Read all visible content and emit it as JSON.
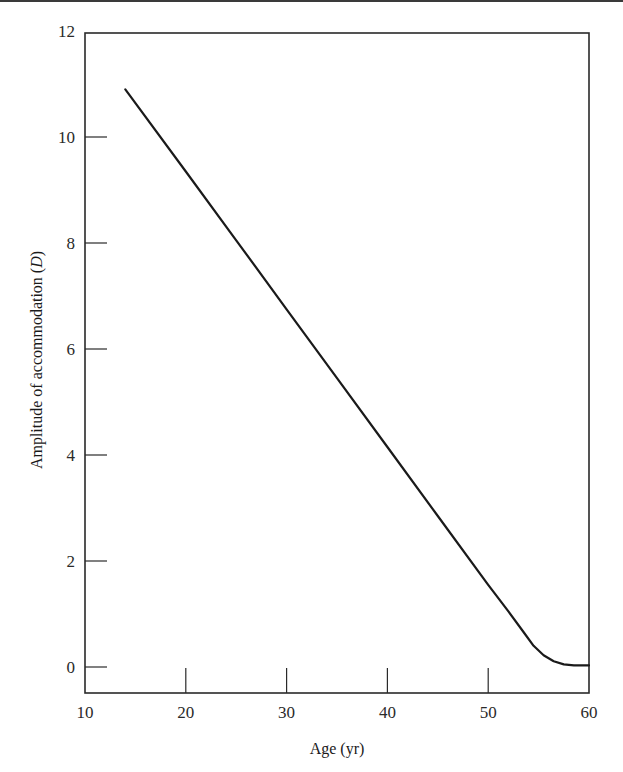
{
  "chart_data": {
    "type": "line",
    "title": "",
    "xlabel": "Age (yr)",
    "ylabel_main": "Amplitude of accommodation (",
    "ylabel_unit": "D",
    "ylabel_close": ")",
    "xlim": [
      10,
      60
    ],
    "ylim": [
      -0.5,
      12
    ],
    "grid": false,
    "legend": null,
    "x_ticks": [
      10,
      20,
      30,
      40,
      50,
      60
    ],
    "y_ticks": [
      0,
      2,
      4,
      6,
      8,
      10,
      12
    ],
    "series": [
      {
        "name": "Amplitude of accommodation",
        "color": "#1a1a1a",
        "x": [
          14,
          20,
          25,
          30,
          35,
          40,
          45,
          50,
          52,
          53.5,
          54.5,
          55.5,
          56.5,
          57.5,
          58.5,
          59.3,
          60
        ],
        "y": [
          10.9,
          9.35,
          8.05,
          6.75,
          5.45,
          4.15,
          2.85,
          1.55,
          1.05,
          0.66,
          0.4,
          0.22,
          0.11,
          0.05,
          0.03,
          0.03,
          0.03
        ]
      }
    ]
  },
  "axes": {
    "x_tick_labels": [
      "10",
      "20",
      "30",
      "40",
      "50",
      "60"
    ],
    "y_tick_labels": [
      "0",
      "2",
      "4",
      "6",
      "8",
      "10",
      "12"
    ]
  }
}
